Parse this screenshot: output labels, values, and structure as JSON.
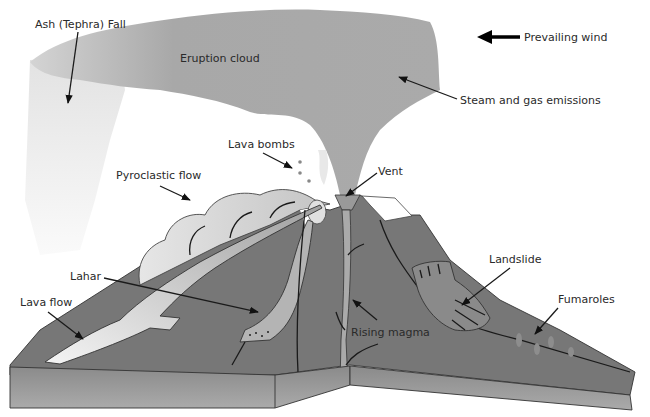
{
  "diagram": {
    "labels": {
      "ash_fall": "Ash (Tephra) Fall",
      "eruption_cloud": "Eruption cloud",
      "prevailing_wind": "Prevailing wind",
      "steam_gas": "Steam and gas emissions",
      "lava_bombs": "Lava bombs",
      "vent": "Vent",
      "pyroclastic_flow": "Pyroclastic flow",
      "lahar": "Lahar",
      "lava_flow": "Lava flow",
      "landslide": "Landslide",
      "rising_magma": "Rising magma",
      "fumaroles": "Fumaroles"
    },
    "colors": {
      "cloud": "#a9a9a9",
      "ash_fall": "#ececec",
      "ground": "#767676",
      "ground_face": "#9a9a9a",
      "flow_light": "#d8d8d8",
      "snow": "#ffffff",
      "arrow": "#111111"
    }
  }
}
